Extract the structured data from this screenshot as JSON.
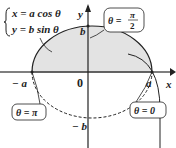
{
  "equations": {
    "line1": "x = a cos θ",
    "line2": "y = b sin θ"
  },
  "axes": {
    "x_label": "x",
    "y_label": "y",
    "origin_label": "0"
  },
  "points": {
    "a_pos": "a",
    "a_neg": "− a",
    "b_pos": "b",
    "b_neg": "− b"
  },
  "callouts": {
    "top": {
      "text": "θ = π/2",
      "lhs": "θ =",
      "num": "π",
      "den": "2"
    },
    "left": {
      "text": "θ = π"
    },
    "right": {
      "text": "θ = 0"
    }
  },
  "colors": {
    "fill": "#e3e3e3",
    "stroke": "#222222"
  }
}
